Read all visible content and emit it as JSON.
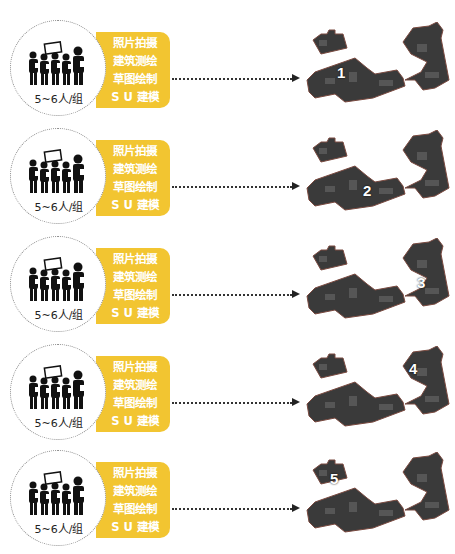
{
  "colors": {
    "panel": "#f2c531",
    "panel_text": "#ffffff",
    "arrow": "#333333",
    "map_dark": "#3a3a3a",
    "map_outline": "#7a4a40"
  },
  "rows": [
    {
      "group_label": "5~6人/组",
      "tasks": [
        "照片拍摄",
        "建筑测绘",
        "草图绘制",
        "S U 建模"
      ],
      "map_number": "1",
      "number_pos": {
        "left": 32,
        "top": 42
      }
    },
    {
      "group_label": "5~6人/组",
      "tasks": [
        "照片拍摄",
        "建筑测绘",
        "草图绘制",
        "S U 建模"
      ],
      "map_number": "2",
      "number_pos": {
        "left": 58,
        "top": 52
      }
    },
    {
      "group_label": "5~6人/组",
      "tasks": [
        "照片拍摄",
        "建筑测绘",
        "草图绘制",
        "S U 建模"
      ],
      "map_number": "3",
      "number_pos": {
        "left": 112,
        "top": 36
      }
    },
    {
      "group_label": "5~6人/组",
      "tasks": [
        "照片拍摄",
        "建筑测绘",
        "草图绘制",
        "S U 建模"
      ],
      "map_number": "4",
      "number_pos": {
        "left": 104,
        "top": 14
      }
    },
    {
      "group_label": "5~6人/组",
      "tasks": [
        "照片拍摄",
        "建筑测绘",
        "草图绘制",
        "S U 建模"
      ],
      "map_number": "5",
      "number_pos": {
        "left": 25,
        "top": 18
      }
    }
  ]
}
